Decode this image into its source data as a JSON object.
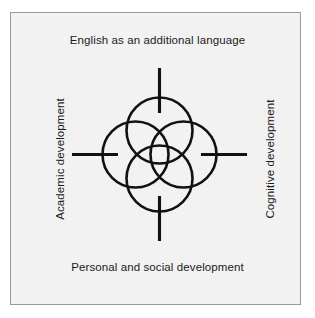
{
  "figure": {
    "title_top": "English as an additional language",
    "title_bottom": "Personal and social development",
    "title_left": "Academic development",
    "title_right": "Cognitive development",
    "frame_background": "#f2f2f2",
    "frame_border_color": "#9a9a9a",
    "stroke_color": "#111111",
    "page_background": "#ffffff"
  },
  "diagram": {
    "type": "four-circle-overlap-rosette",
    "center": {
      "x": 159.5,
      "y": 154.5
    },
    "circle_radius": 33,
    "center_offset": 24,
    "circles": [
      {
        "name": "top-circle",
        "cx": 159.5,
        "cy": 130.5,
        "r": 33
      },
      {
        "name": "right-circle",
        "cx": 183.5,
        "cy": 154.5,
        "r": 33
      },
      {
        "name": "bottom-circle",
        "cx": 159.5,
        "cy": 178.5,
        "r": 33
      },
      {
        "name": "left-circle",
        "cx": 135.5,
        "cy": 154.5,
        "r": 33
      }
    ],
    "ticks": [
      {
        "name": "tick-top",
        "x1": 159.5,
        "y1": 68,
        "x2": 159.5,
        "y2": 113
      },
      {
        "name": "tick-bottom",
        "x1": 159.5,
        "y1": 196,
        "x2": 159.5,
        "y2": 241
      },
      {
        "name": "tick-left",
        "x1": 72,
        "y1": 154.5,
        "x2": 118,
        "y2": 154.5
      },
      {
        "name": "tick-right",
        "x1": 201,
        "y1": 154.5,
        "x2": 247,
        "y2": 154.5
      }
    ]
  }
}
